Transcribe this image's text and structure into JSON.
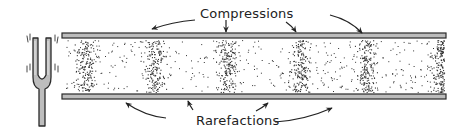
{
  "diagram": {
    "labels": {
      "top": "Compressions",
      "bottom": "Rarefactions"
    },
    "colors": {
      "background": "#ffffff",
      "tube_wall_fill": "#bcbcbc",
      "tube_wall_stroke": "#2a2a2a",
      "fork_fill": "#bdbdbd",
      "fork_stroke": "#2a2a2a",
      "particle": "#333333",
      "arrow": "#222222"
    },
    "tube": {
      "x_start": 62,
      "x_end": 446,
      "top_wall_y": 33,
      "bottom_wall_y": 94,
      "wall_thickness": 5,
      "interior_top": 39,
      "interior_bottom": 93
    },
    "compression_centers_x": [
      85,
      155,
      227,
      300,
      367,
      440
    ],
    "particles": {
      "background_count": 420,
      "per_compression_count": 170,
      "compression_spread_x": 7,
      "seed": 7
    },
    "tuning_fork": {
      "x": 33,
      "y": 38,
      "prong_width": 5,
      "gap": 8,
      "prong_height": 43,
      "stem_width": 6,
      "stem_bottom": 126,
      "vibration_marks": true
    },
    "arrows": {
      "compressions": [
        {
          "from": [
            195,
            20
          ],
          "to": [
            152,
            29
          ],
          "curve": [
            172,
            22
          ]
        },
        {
          "from": [
            226,
            20
          ],
          "to": [
            226,
            32
          ],
          "curve": [
            226,
            26
          ]
        },
        {
          "from": [
            286,
            22
          ],
          "to": [
            296,
            32
          ],
          "curve": [
            292,
            26
          ]
        },
        {
          "from": [
            330,
            15
          ],
          "to": [
            362,
            33
          ],
          "curve": [
            350,
            20
          ]
        }
      ],
      "rarefactions": [
        {
          "from": [
            166,
            118
          ],
          "to": [
            126,
            103
          ],
          "curve": [
            145,
            116
          ]
        },
        {
          "from": [
            193,
            110
          ],
          "to": [
            188,
            101
          ],
          "curve": [
            190,
            106
          ]
        },
        {
          "from": [
            256,
            111
          ],
          "to": [
            268,
            103
          ],
          "curve": [
            262,
            108
          ]
        },
        {
          "from": [
            275,
            122
          ],
          "to": [
            332,
            108
          ],
          "curve": [
            305,
            120
          ]
        }
      ]
    }
  }
}
